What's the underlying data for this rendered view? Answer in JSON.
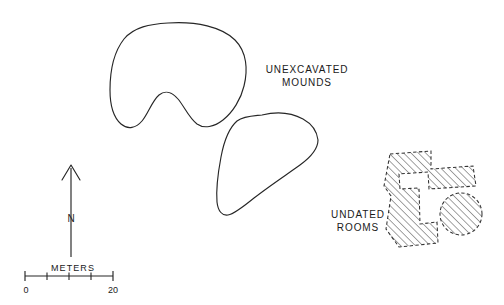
{
  "figure": {
    "kind": "archaeological-site-plan",
    "background_color": "#ffffff",
    "ink_color": "#1a1a1a"
  },
  "labels": {
    "unexcavated_mounds": "UNEXCAVATED\nMOUNDS",
    "undated_rooms": "UNDATED\nROOMS"
  },
  "north_arrow": {
    "label": "N"
  },
  "scale_bar": {
    "caption": "METERS",
    "min_label": "0",
    "max_label": "20",
    "units": "meters",
    "min_value": 0,
    "max_value": 20,
    "divisions": 4,
    "division_value": 5
  },
  "features": {
    "mounds": [
      {
        "name": "upper-mound",
        "style": "outline"
      },
      {
        "name": "lower-mound",
        "style": "outline"
      }
    ],
    "rooms": [
      {
        "name": "room-block",
        "style": "dashed-hatched"
      },
      {
        "name": "round-room",
        "style": "dashed-hatched"
      }
    ]
  }
}
